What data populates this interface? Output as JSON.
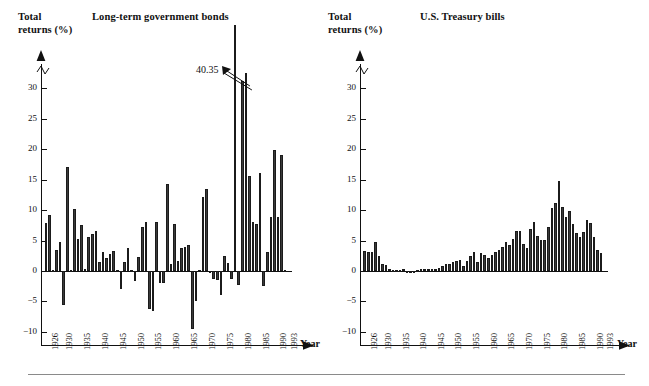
{
  "figure": {
    "bottom_rule": true,
    "bar_color": "#3a3a3a",
    "axis_color": "#111111"
  },
  "panels": [
    {
      "id": "long-term-government-bonds",
      "chart_title": "Long-term government bonds",
      "axis_title_line1": "Total",
      "axis_title_line2": "returns (%)",
      "xaxis_label": "Year",
      "annotation": {
        "text": "40.35",
        "points_to_year": 1982
      }
    },
    {
      "id": "us-treasury-bills",
      "chart_title": "U.S. Treasury bills",
      "axis_title_line1": "Total",
      "axis_title_line2": "returns (%)",
      "xaxis_label": "Year",
      "annotation": null
    }
  ],
  "chart_data": [
    {
      "type": "bar",
      "title": "Long-term government bonds",
      "xlabel": "Year",
      "ylabel": "Total returns (%)",
      "ylim": [
        -10,
        32
      ],
      "yticks": [
        -10,
        -5,
        0,
        5,
        10,
        15,
        20,
        25,
        30
      ],
      "axis_break_above": 30,
      "grid": false,
      "legend": null,
      "xticklabels": [
        "1926",
        "1930",
        "1935",
        "1940",
        "1945",
        "1950",
        "1955",
        "1960",
        "1965",
        "1970",
        "1975",
        "1980",
        "1985",
        "1990",
        "1993"
      ],
      "x": [
        1926,
        1927,
        1928,
        1929,
        1930,
        1931,
        1932,
        1933,
        1934,
        1935,
        1936,
        1937,
        1938,
        1939,
        1940,
        1941,
        1942,
        1943,
        1944,
        1945,
        1946,
        1947,
        1948,
        1949,
        1950,
        1951,
        1952,
        1953,
        1954,
        1955,
        1956,
        1957,
        1958,
        1959,
        1960,
        1961,
        1962,
        1963,
        1964,
        1965,
        1966,
        1967,
        1968,
        1969,
        1970,
        1971,
        1972,
        1973,
        1974,
        1975,
        1976,
        1977,
        1978,
        1979,
        1980,
        1981,
        1982,
        1983,
        1984,
        1985,
        1986,
        1987,
        1988,
        1989,
        1990,
        1991,
        1992,
        1993
      ],
      "values": [
        7.9,
        9.2,
        0.1,
        3.4,
        4.7,
        -5.5,
        17.0,
        0.2,
        10.2,
        5.3,
        7.6,
        0.3,
        5.5,
        6.0,
        6.6,
        1.4,
        3.2,
        2.1,
        2.8,
        3.3,
        0.2,
        -3.0,
        1.4,
        3.7,
        0.2,
        -1.7,
        2.3,
        7.3,
        8.0,
        -6.2,
        -6.6,
        8.0,
        -2.0,
        -1.9,
        14.2,
        1.2,
        7.7,
        1.6,
        3.8,
        3.9,
        4.2,
        -9.5,
        -4.9,
        0.1,
        12.1,
        13.4,
        -0.4,
        -1.3,
        -1.5,
        -4.0,
        2.5,
        1.3,
        -1.3,
        40.35,
        -2.3,
        31.1,
        25.2,
        15.6,
        8.0,
        7.7,
        16.1,
        -2.5,
        3.2,
        8.8,
        19.8,
        8.8,
        19.1,
        0.1
      ],
      "truncated_bars": [
        {
          "year": 1982,
          "value": 40.35,
          "label": "40.35"
        }
      ]
    },
    {
      "type": "bar",
      "title": "U.S. Treasury bills",
      "xlabel": "Year",
      "ylabel": "Total returns (%)",
      "ylim": [
        -10,
        32
      ],
      "yticks": [
        -10,
        -5,
        0,
        5,
        10,
        15,
        20,
        25,
        30
      ],
      "axis_break_above": 30,
      "grid": false,
      "legend": null,
      "xticklabels": [
        "1926",
        "1930",
        "1935",
        "1940",
        "1945",
        "1950",
        "1955",
        "1960",
        "1965",
        "1970",
        "1975",
        "1980",
        "1985",
        "1990",
        "1993"
      ],
      "x": [
        1926,
        1927,
        1928,
        1929,
        1930,
        1931,
        1932,
        1933,
        1934,
        1935,
        1936,
        1937,
        1938,
        1939,
        1940,
        1941,
        1942,
        1943,
        1944,
        1945,
        1946,
        1947,
        1948,
        1949,
        1950,
        1951,
        1952,
        1953,
        1954,
        1955,
        1956,
        1957,
        1958,
        1959,
        1960,
        1961,
        1962,
        1963,
        1964,
        1965,
        1966,
        1967,
        1968,
        1969,
        1970,
        1971,
        1972,
        1973,
        1974,
        1975,
        1976,
        1977,
        1978,
        1979,
        1980,
        1981,
        1982,
        1983,
        1984,
        1985,
        1986,
        1987,
        1988,
        1989,
        1990,
        1991,
        1992,
        1993
      ],
      "values": [
        3.3,
        3.1,
        3.2,
        4.8,
        2.4,
        1.1,
        1.0,
        0.3,
        0.2,
        0.2,
        0.2,
        0.3,
        0.0,
        0.0,
        0.0,
        0.1,
        0.3,
        0.4,
        0.3,
        0.3,
        0.4,
        0.5,
        0.8,
        1.1,
        1.2,
        1.5,
        1.7,
        1.8,
        0.9,
        1.6,
        2.5,
        3.1,
        1.5,
        3.0,
        2.7,
        2.1,
        2.7,
        3.1,
        3.5,
        3.9,
        4.8,
        4.2,
        5.2,
        6.6,
        6.5,
        4.4,
        3.8,
        6.9,
        8.0,
        5.8,
        5.1,
        5.1,
        7.2,
        10.4,
        11.2,
        14.7,
        10.5,
        8.8,
        9.9,
        7.7,
        6.2,
        5.5,
        6.4,
        8.4,
        7.8,
        5.6,
        3.5,
        2.9
      ]
    }
  ]
}
